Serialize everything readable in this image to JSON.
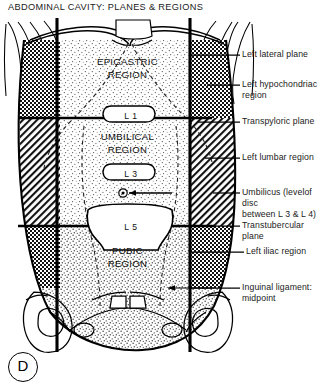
{
  "figure": {
    "title": "ABDOMINAL CAVITY: PLANES & REGIONS",
    "panel_letter": "D"
  },
  "regions": [
    {
      "name": "epigastric",
      "label": "EPIGASTRIC\nREGION"
    },
    {
      "name": "umbilical",
      "label": "UMBILICAL\nREGION"
    },
    {
      "name": "pubic",
      "label": "PUBIC\nREGION"
    }
  ],
  "vertebrae": [
    {
      "name": "l1",
      "label": "L 1"
    },
    {
      "name": "l3",
      "label": "L 3"
    },
    {
      "name": "l5",
      "label": "L 5"
    }
  ],
  "annotations": [
    {
      "name": "left-lateral-plane",
      "line1": "Left lateral plane",
      "line2": ""
    },
    {
      "name": "left-hypochondriac",
      "line1": "Left hypochondriac",
      "line2": "region"
    },
    {
      "name": "transpyloric-plane",
      "line1": "Transpyloric plane",
      "line2": ""
    },
    {
      "name": "left-lumbar-region",
      "line1": "Left lumbar region",
      "line2": ""
    },
    {
      "name": "umbilicus",
      "line1": "Umbilicus (levelof disc",
      "line2": "between L 3 & L 4)"
    },
    {
      "name": "transtubercular-plane",
      "line1": "Transtubercular plane",
      "line2": ""
    },
    {
      "name": "left-iliac-region",
      "line1": "Left iliac region",
      "line2": ""
    },
    {
      "name": "inguinal-ligament",
      "line1": "Inguinal ligament:",
      "line2": "midpoint"
    }
  ],
  "colors": {
    "ink": "#000000",
    "paper": "#ffffff",
    "stipple": "#5a5a5a"
  }
}
